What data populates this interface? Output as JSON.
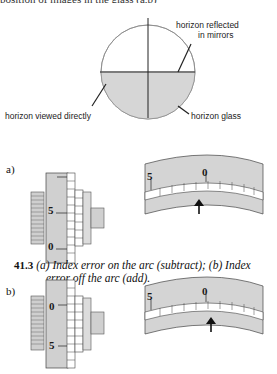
{
  "top_clipped_text": "position of images in the glass (a,b)",
  "horizon_diagram": {
    "labels": {
      "reflected": [
        "horizon reflected",
        "in mirrors"
      ],
      "direct": "horizon viewed directly",
      "glass": "horizon glass"
    }
  },
  "figure_a": {
    "label": "a)",
    "micrometer": {
      "marks": [
        "5",
        "0"
      ]
    },
    "arc": {
      "marks": [
        "5",
        "0"
      ]
    }
  },
  "caption": {
    "number": "41.3",
    "line1": "(a) Index error on the arc (subtract); (b) Index",
    "line2": "error off the arc (add)."
  },
  "figure_b": {
    "label": "b)",
    "micrometer": {
      "marks": [
        "0",
        "5"
      ]
    },
    "arc": {
      "marks": [
        "5",
        "0"
      ]
    }
  },
  "colors": {
    "shade": "#d4d4d4",
    "line": "#222222"
  }
}
